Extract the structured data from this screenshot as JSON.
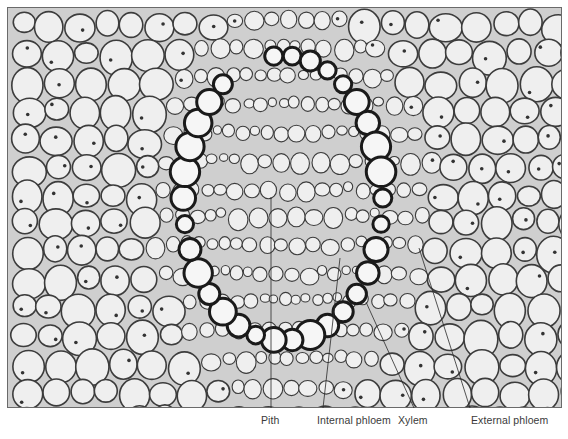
{
  "figure": {
    "type": "light micrograph",
    "labels": [
      {
        "id": "pith",
        "text": "Pith",
        "label_x": 261,
        "line": [
          271,
          197,
          271,
          408
        ]
      },
      {
        "id": "internal-phloem",
        "text": "Internal phloem",
        "label_x": 317,
        "line": [
          340,
          258,
          323,
          408
        ]
      },
      {
        "id": "xylem",
        "text": "Xylem",
        "label_x": 398,
        "line": [
          366,
          302,
          414,
          408
        ]
      },
      {
        "id": "external-phloem",
        "text": "External phloem",
        "label_x": 471,
        "line": [
          419,
          248,
          470,
          408
        ]
      }
    ],
    "colors": {
      "background": "#ffffff",
      "cell_wall": "#3c3c3c",
      "cell_interior": "#efefef",
      "xylem_wall": "#1a1a1a",
      "label_text": "#3a3a3a",
      "leader_line": "#2a2a2a"
    }
  }
}
